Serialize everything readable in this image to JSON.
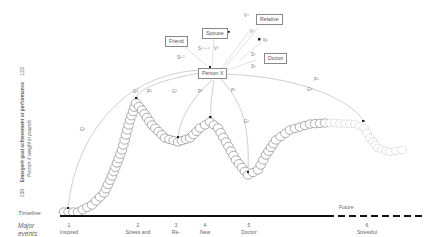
{
  "diagram": {
    "y_axis": {
      "label": "Emergent goal achievement or performance",
      "sublabel": "Person X weight in pounds",
      "top_value": "120",
      "bottom_value": "200"
    },
    "timeline_label": "Timeline",
    "events_label_line1": "Major",
    "events_label_line2": "events",
    "future_label": "Future",
    "central_node": "Person X",
    "actors": [
      {
        "label": "Friend"
      },
      {
        "label": "Spouse"
      },
      {
        "label": "Relative"
      },
      {
        "label": "Doctor"
      }
    ],
    "relation_labels": {
      "s_friend": "S¹·³",
      "s_spouse": "S⁴·⁵·⁶",
      "v_spouse": "V⁴",
      "v_relative_top": "V⁴",
      "v_relative_mid": "V⁴",
      "n_relative": "N⁵",
      "s_doctor_1": "S⁵",
      "s_doctor_2": "S⁵",
      "g1": "G¹",
      "g2": "G²",
      "p2": "P²",
      "g3": "G³",
      "p3": "P³",
      "p4": "P⁴",
      "g5": "G⁵",
      "p6": "P⁶",
      "g6": "G⁶"
    },
    "events": [
      {
        "num": "1",
        "line1": "Inspired",
        "line2": "by friend"
      },
      {
        "num": "2",
        "line1": "Stress and",
        "line2": "overeating"
      },
      {
        "num": "3",
        "line1": "Re-",
        "line2": "inspired"
      },
      {
        "num": "4",
        "line1": "New",
        "line2": "family"
      },
      {
        "num": "5",
        "line1": "Doctor",
        "line2": "discussion"
      },
      {
        "num": "6",
        "line1": "Stressful",
        "line2": "move"
      }
    ]
  }
}
